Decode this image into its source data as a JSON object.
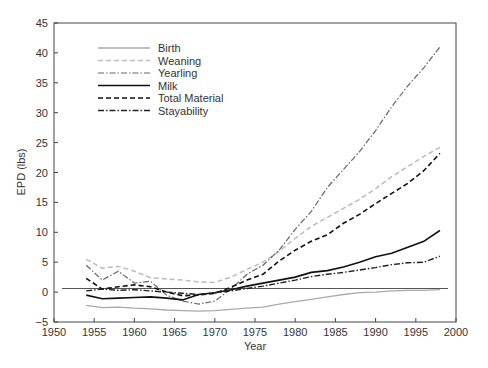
{
  "chart_data": {
    "type": "line",
    "title": "",
    "xlabel": "Year",
    "ylabel": "EPD (lbs)",
    "xlim": [
      1950,
      2000
    ],
    "ylim": [
      -5,
      45
    ],
    "xticks": [
      1950,
      1955,
      1960,
      1965,
      1970,
      1975,
      1980,
      1985,
      1990,
      1995,
      2000
    ],
    "yticks": [
      -5,
      0,
      5,
      10,
      15,
      20,
      25,
      30,
      35,
      40,
      45
    ],
    "grid": false,
    "legend_position": "upper left",
    "x": [
      1954,
      1956,
      1958,
      1960,
      1962,
      1964,
      1966,
      1968,
      1970,
      1972,
      1974,
      1976,
      1978,
      1980,
      1982,
      1984,
      1986,
      1988,
      1990,
      1992,
      1994,
      1996,
      1998
    ],
    "series": [
      {
        "name": "Birth",
        "style": "solid",
        "color": "#aaaaaa",
        "width": 1.3,
        "values": [
          -2.2,
          -2.6,
          -2.5,
          -2.7,
          -2.8,
          -3.0,
          -3.1,
          -3.2,
          -3.1,
          -2.9,
          -2.7,
          -2.5,
          -2.0,
          -1.6,
          -1.2,
          -0.8,
          -0.4,
          -0.1,
          0.0,
          0.2,
          0.3,
          0.3,
          0.4
        ]
      },
      {
        "name": "Weaning",
        "style": "dashed",
        "color": "#bbbbbb",
        "width": 1.5,
        "values": [
          5.5,
          4.0,
          4.3,
          3.5,
          2.4,
          2.2,
          2.0,
          1.7,
          1.6,
          2.5,
          3.8,
          5.0,
          6.8,
          9.0,
          11.0,
          12.5,
          14.0,
          15.5,
          17.3,
          19.3,
          21.0,
          22.7,
          24.2
        ]
      },
      {
        "name": "Yearling",
        "style": "dashdot",
        "color": "#666666",
        "width": 1.2,
        "values": [
          4.5,
          2.0,
          3.5,
          1.5,
          1.8,
          -0.5,
          -1.5,
          -2.0,
          -1.5,
          0.5,
          3.0,
          4.5,
          7.0,
          10.5,
          13.5,
          17.5,
          20.5,
          23.5,
          27.0,
          31.0,
          34.5,
          37.5,
          41.0
        ]
      },
      {
        "name": "Milk",
        "style": "solid",
        "color": "#111111",
        "width": 1.6,
        "values": [
          -0.5,
          -1.1,
          -1.0,
          -0.9,
          -0.8,
          -1.0,
          -1.3,
          -0.4,
          -0.1,
          0.4,
          1.0,
          1.5,
          2.0,
          2.5,
          3.3,
          3.6,
          4.2,
          5.0,
          5.9,
          6.5,
          7.5,
          8.5,
          10.3
        ]
      },
      {
        "name": "Total Material",
        "style": "dashed",
        "color": "#111111",
        "width": 1.6,
        "values": [
          2.3,
          0.5,
          0.9,
          1.2,
          0.9,
          0.0,
          -0.6,
          -0.5,
          -0.2,
          0.8,
          2.0,
          3.0,
          5.2,
          7.0,
          8.5,
          9.6,
          11.5,
          13.0,
          14.8,
          16.5,
          18.2,
          20.3,
          23.2
        ]
      },
      {
        "name": "Stayability",
        "style": "dashdot",
        "color": "#222222",
        "width": 1.4,
        "values": [
          0.2,
          0.5,
          0.3,
          0.4,
          0.2,
          0.0,
          -0.2,
          -0.4,
          -0.1,
          0.2,
          0.6,
          1.0,
          1.5,
          2.0,
          2.6,
          3.0,
          3.3,
          3.7,
          4.1,
          4.6,
          4.9,
          5.0,
          6.0
        ]
      }
    ],
    "reference_line": {
      "y": 0.6,
      "x_range": [
        1951,
        1999
      ],
      "color": "#555555"
    }
  },
  "legend": {
    "items": [
      "Birth",
      "Weaning",
      "Yearling",
      "Milk",
      "Total Material",
      "Stayability"
    ]
  },
  "axes": {
    "xlabel": "Year",
    "ylabel": "EPD (lbs)"
  }
}
